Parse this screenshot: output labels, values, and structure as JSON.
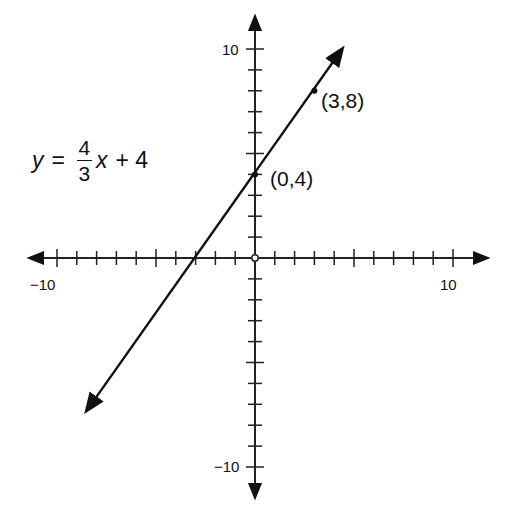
{
  "chart_data": {
    "type": "line",
    "title": "",
    "equation": {
      "lhs": "y",
      "equals": "=",
      "numerator": "4",
      "denominator": "3",
      "var": "x",
      "rest": "+ 4",
      "full": "y = 4/3 x + 4"
    },
    "slope": 1.3333,
    "intercept": 4,
    "xlim": [
      -10,
      10
    ],
    "ylim": [
      -10,
      10
    ],
    "x_tick_step": 1,
    "y_tick_step": 1,
    "x_tick_labels": [
      "-10",
      "10"
    ],
    "y_tick_labels": [
      "10",
      "-10"
    ],
    "grid": false,
    "series": [
      {
        "name": "y = 4/3 x + 4",
        "x": [
          -8.5,
          0,
          3,
          4.4
        ],
        "y": [
          -7.3,
          4,
          8,
          10
        ]
      }
    ],
    "points": [
      {
        "x": 0,
        "y": 4,
        "label": "(0,4)"
      },
      {
        "x": 3,
        "y": 8,
        "label": "(3,8)"
      }
    ],
    "xlabel": "",
    "ylabel": ""
  },
  "labels": {
    "x_min": "−10",
    "x_max": "10",
    "y_max": "10",
    "y_min": "−10",
    "point_a": "(3,8)",
    "point_b": "(0,4)"
  }
}
